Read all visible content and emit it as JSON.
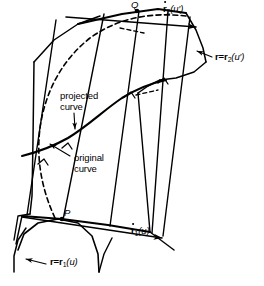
{
  "figure": {
    "type": "geometric-diagram",
    "background": "#ffffff",
    "line_color": "#000000"
  },
  "labels": {
    "point_p": "P",
    "point_q": "Q",
    "tangent_lower": {
      "symbol": "r",
      "accent": "dot",
      "subscript": "1",
      "argument": "(u)"
    },
    "tangent_upper": {
      "symbol": "r",
      "accent": "dot",
      "subscript": "2",
      "argument": "(u′)"
    },
    "curve_lower": {
      "prefix": "r=",
      "symbol": "r",
      "subscript": "1",
      "argument": "(u)"
    },
    "curve_upper": {
      "prefix": "r=",
      "symbol": "r",
      "subscript": "2",
      "argument": "(u′)"
    },
    "projected_curve_line1": "projected",
    "projected_curve_line2": "curve",
    "original_curve_line1": "original",
    "original_curve_line2": "curve"
  },
  "geometry": {
    "surface_outline": "M 20,28 L 44,20 L 86,10 L 158,8 L 196,16 L 208,62 L 200,76 L 168,232 L 150,236 L 90,226 L 30,219 L 12,214 L 15,130 Z",
    "rulings": [
      "M 27,219 L 55,17",
      "M 63,222 L 103,11",
      "M 108,227 L 137,9",
      "M 149,234 L 166,9",
      "M 160,236 L 190,14"
    ],
    "projected_curve": "M 20,151 L 40,146 L 62,139 L 84,126 L 104,110 L 124,97 L 144,88 L 160,82",
    "original_curve": "M 52,219 L 44,196 L 38,170 L 36,146 L 40,120 L 50,92 L 66,66 L 88,44 L 112,32 L 140,25 L 166,22 L 190,24",
    "top_arc": "M 160,9 L 188,14 L 202,38 L 208,62",
    "bottom_arc_major": "M 20,246 L 26,232 L 42,222 L 62,219 L 86,224 L 104,240 L 112,260 L 114,278",
    "bottom_arc_minor": "M 4,278 L 6,258 L 12,240 L 20,230 L 30,222",
    "tick_marks": [
      "M 112,96 L 118,92 L 123,97",
      "M 156,82 L 162,78 L 166,84",
      "M 60,149 L 66,145 L 69,151",
      "M 44,156 L 50,152"
    ]
  },
  "arrows": {
    "tangent_lower_arrow": {
      "from": [
        20,
        219
      ],
      "to": [
        170,
        238
      ]
    },
    "tangent_upper_arrow": {
      "from": [
        60,
        13
      ],
      "to": [
        196,
        26
      ]
    },
    "leader_curve_upper": {
      "from": [
        214,
        58
      ],
      "to": [
        196,
        52
      ]
    },
    "leader_curve_lower": {
      "from": [
        50,
        264
      ],
      "to": [
        24,
        260
      ]
    },
    "leader_projected": {
      "from": [
        76,
        116
      ],
      "to": [
        78,
        131
      ]
    },
    "leader_original": {
      "from": [
        72,
        158
      ],
      "to": [
        48,
        146
      ]
    }
  }
}
